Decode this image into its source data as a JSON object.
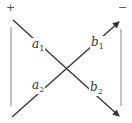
{
  "diagram": {
    "type": "butterfly",
    "colors": {
      "line": "#333333",
      "bracket": "#888888",
      "text": "#333333"
    },
    "signs": {
      "left": "+",
      "right": "−"
    },
    "labels": {
      "a1": {
        "base": "a",
        "sub": "1"
      },
      "a2": {
        "base": "a",
        "sub": "2"
      },
      "b1": {
        "base": "b",
        "sub": "1"
      },
      "b2": {
        "base": "b",
        "sub": "2"
      }
    },
    "edges": [
      {
        "from": "top-left",
        "to": "bottom-right",
        "labels": [
          "a1",
          "b2"
        ],
        "arrow": "end"
      },
      {
        "from": "bottom-left",
        "to": "top-right",
        "labels": [
          "a2",
          "b1"
        ],
        "arrow": "end"
      }
    ]
  }
}
